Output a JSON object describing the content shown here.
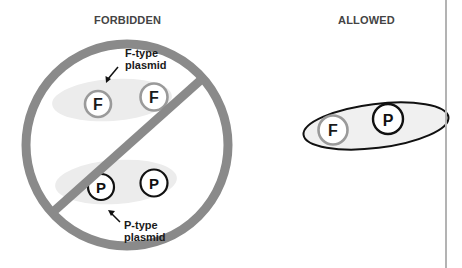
{
  "headings": {
    "forbidden": "FORBIDDEN",
    "allowed": "ALLOWED"
  },
  "labels": {
    "f_type_line1": "F-type",
    "f_type_line2": "plasmid",
    "p_type_line1": "P-type",
    "p_type_line2": "plasmid"
  },
  "forbidden_panel": {
    "symbol": "prohibition-sign",
    "groups": [
      {
        "name": "F-type pair",
        "plasmids": [
          "F",
          "F"
        ]
      },
      {
        "name": "P-type pair",
        "plasmids": [
          "P",
          "P"
        ]
      }
    ]
  },
  "allowed_panel": {
    "group": {
      "name": "Mixed pair",
      "plasmids": [
        "F",
        "P"
      ]
    }
  },
  "plasmid_letters": {
    "f1": "F",
    "f2": "F",
    "p1": "P",
    "p2": "P",
    "allowed_f": "F",
    "allowed_p": "P"
  },
  "colors": {
    "prohibition_gray": "#8a8a8a",
    "cell_fill": "#ececec",
    "f_ring": "#9a9a9a",
    "p_ring": "#111111",
    "text": "#1a1a1a",
    "divider": "#b3b3b3"
  }
}
